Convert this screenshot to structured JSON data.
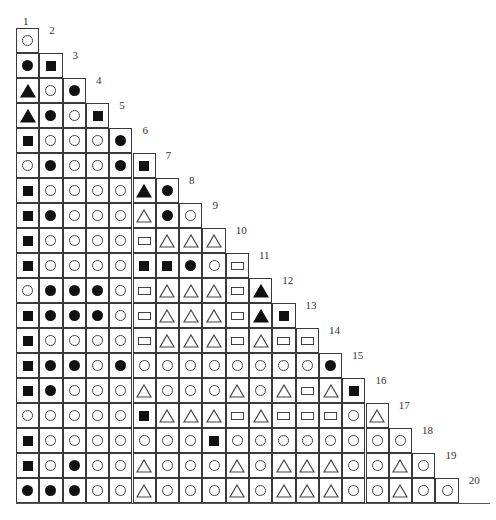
{
  "diagram": {
    "type": "triangular-symbol-matrix",
    "labels": [
      "1",
      "2",
      "3",
      "4",
      "5",
      "6",
      "7",
      "8",
      "9",
      "10",
      "11",
      "12",
      "13",
      "14",
      "15",
      "16",
      "17",
      "18",
      "19",
      "20"
    ],
    "legend_symbols": {
      "oc": "open-circle",
      "fc": "filled-circle",
      "fs": "filled-square",
      "or": "open-rectangle",
      "ot": "open-triangle",
      "ft": "filled-triangle"
    },
    "rows": [
      [
        "oc"
      ],
      [
        "fc",
        "fs"
      ],
      [
        "ft",
        "oc",
        "fc"
      ],
      [
        "ft",
        "fc",
        "oc",
        "fs"
      ],
      [
        "fs",
        "oc",
        "oc",
        "oc",
        "fc"
      ],
      [
        "oc",
        "fc",
        "oc",
        "oc",
        "fc",
        "fs"
      ],
      [
        "fs",
        "oc",
        "oc",
        "oc",
        "oc",
        "ft",
        "fc"
      ],
      [
        "fs",
        "fc",
        "oc",
        "oc",
        "oc",
        "ot",
        "fc",
        "oc"
      ],
      [
        "fs",
        "oc",
        "oc",
        "oc",
        "oc",
        "or",
        "ot",
        "ot",
        "ot"
      ],
      [
        "fs",
        "oc",
        "oc",
        "oc",
        "oc",
        "fs",
        "fs",
        "fc",
        "oc",
        "or"
      ],
      [
        "oc",
        "fc",
        "fc",
        "fc",
        "oc",
        "or",
        "ot",
        "ot",
        "ot",
        "or",
        "ft"
      ],
      [
        "fs",
        "fc",
        "fc",
        "fc",
        "oc",
        "or",
        "ot",
        "ot",
        "ot",
        "or",
        "ft",
        "fs"
      ],
      [
        "fs",
        "oc",
        "oc",
        "oc",
        "oc",
        "or",
        "ot",
        "ot",
        "ot",
        "or",
        "ot",
        "or",
        "or"
      ],
      [
        "fs",
        "fc",
        "fc",
        "oc",
        "fc",
        "oc",
        "oc",
        "oc",
        "oc",
        "oc",
        "oc",
        "oc",
        "oc",
        "fc"
      ],
      [
        "fs",
        "fc",
        "oc",
        "oc",
        "oc",
        "ot",
        "oc",
        "oc",
        "oc",
        "ot",
        "oc",
        "ot",
        "or",
        "ot",
        "fs"
      ],
      [
        "oc",
        "oc",
        "oc",
        "oc",
        "oc",
        "fs",
        "ot",
        "ot",
        "ot",
        "or",
        "ot",
        "or",
        "or",
        "or",
        "oc",
        "ot"
      ],
      [
        "fs",
        "oc",
        "oc",
        "oc",
        "oc",
        "oc",
        "oc",
        "oc",
        "fs",
        "oc",
        "oc",
        "oc",
        "oc",
        "oc",
        "oc",
        "oc",
        "oc"
      ],
      [
        "fs",
        "oc",
        "fc",
        "oc",
        "oc",
        "ot",
        "oc",
        "oc",
        "oc",
        "ot",
        "oc",
        "ot",
        "ot",
        "ot",
        "oc",
        "oc",
        "ot",
        "oc"
      ],
      [
        "fc",
        "fc",
        "fc",
        "oc",
        "oc",
        "ot",
        "oc",
        "oc",
        "oc",
        "ot",
        "oc",
        "ot",
        "ot",
        "ot",
        "oc",
        "oc",
        "ot",
        "oc",
        "oc"
      ]
    ],
    "colors": {
      "line": "#3a3a3a",
      "fill": "#111111",
      "background": "#ffffff"
    }
  }
}
